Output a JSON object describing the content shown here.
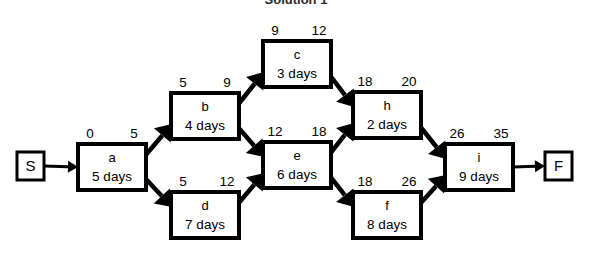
{
  "title": "Solution 1",
  "diagram": {
    "type": "activity-on-node-network",
    "start_node": {
      "label": "S",
      "x": 17,
      "y": 152,
      "w": 27,
      "h": 28
    },
    "end_node": {
      "label": "F",
      "x": 545,
      "y": 152,
      "w": 27,
      "h": 28
    },
    "nodes": [
      {
        "id": "a",
        "label": "a",
        "duration": "5 days",
        "days": 5,
        "early_start": 0,
        "early_finish": 5,
        "x": 78,
        "y": 144,
        "w": 68,
        "h": 46
      },
      {
        "id": "b",
        "label": "b",
        "duration": "4 days",
        "days": 4,
        "early_start": 5,
        "early_finish": 9,
        "x": 171,
        "y": 93,
        "w": 68,
        "h": 46
      },
      {
        "id": "d",
        "label": "d",
        "duration": "7 days",
        "days": 7,
        "early_start": 5,
        "early_finish": 12,
        "x": 171,
        "y": 192,
        "w": 68,
        "h": 46
      },
      {
        "id": "c",
        "label": "c",
        "duration": "3 days",
        "days": 3,
        "early_start": 9,
        "early_finish": 12,
        "x": 263,
        "y": 41,
        "w": 68,
        "h": 46
      },
      {
        "id": "e",
        "label": "e",
        "duration": "6 days",
        "days": 6,
        "early_start": 12,
        "early_finish": 18,
        "x": 263,
        "y": 142,
        "w": 68,
        "h": 46
      },
      {
        "id": "h",
        "label": "h",
        "duration": "2 days",
        "days": 2,
        "early_start": 18,
        "early_finish": 20,
        "x": 353,
        "y": 92,
        "w": 68,
        "h": 46
      },
      {
        "id": "f",
        "label": "f",
        "duration": "8 days",
        "days": 8,
        "early_start": 18,
        "early_finish": 26,
        "x": 353,
        "y": 192,
        "w": 68,
        "h": 46
      },
      {
        "id": "i",
        "label": "i",
        "duration": "9 days",
        "days": 9,
        "early_start": 26,
        "early_finish": 35,
        "x": 445,
        "y": 144,
        "w": 68,
        "h": 46
      }
    ],
    "edges": [
      {
        "from": "S",
        "to": "a",
        "kind": "thin"
      },
      {
        "from": "a",
        "to": "b",
        "kind": "thick"
      },
      {
        "from": "a",
        "to": "d",
        "kind": "thick"
      },
      {
        "from": "b",
        "to": "c",
        "kind": "thick"
      },
      {
        "from": "b",
        "to": "e",
        "kind": "thick"
      },
      {
        "from": "d",
        "to": "e",
        "kind": "thick"
      },
      {
        "from": "c",
        "to": "h",
        "kind": "thick"
      },
      {
        "from": "e",
        "to": "h",
        "kind": "thick"
      },
      {
        "from": "e",
        "to": "f",
        "kind": "thick"
      },
      {
        "from": "h",
        "to": "i",
        "kind": "thick"
      },
      {
        "from": "f",
        "to": "i",
        "kind": "thick"
      },
      {
        "from": "i",
        "to": "F",
        "kind": "thin"
      }
    ],
    "project_duration": 35
  },
  "chart_data": {
    "type": "diagram",
    "title": "Solution 1",
    "categories": [
      "a",
      "b",
      "d",
      "c",
      "e",
      "h",
      "f",
      "i"
    ],
    "series": [
      {
        "name": "duration_days",
        "values": [
          5,
          4,
          7,
          3,
          6,
          2,
          8,
          9
        ]
      },
      {
        "name": "early_start",
        "values": [
          0,
          5,
          5,
          9,
          12,
          18,
          18,
          26
        ]
      },
      {
        "name": "early_finish",
        "values": [
          5,
          9,
          12,
          12,
          18,
          20,
          26,
          35
        ]
      }
    ]
  }
}
